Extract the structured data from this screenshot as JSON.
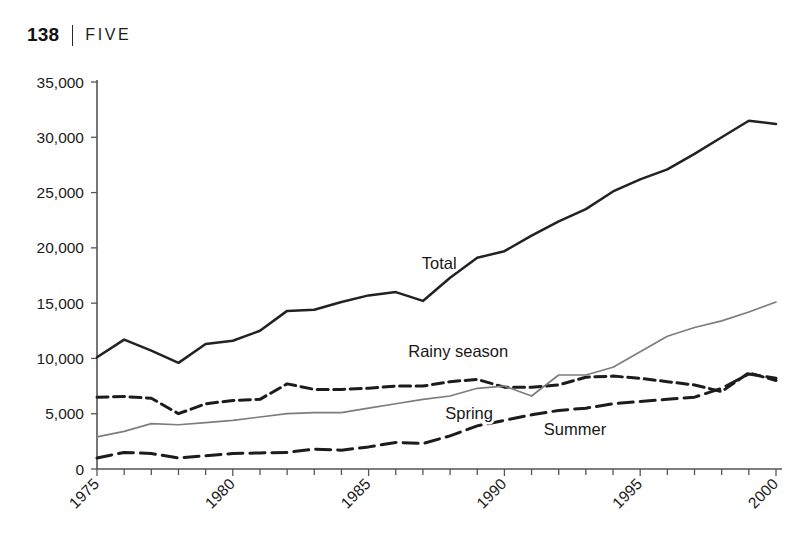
{
  "header": {
    "page_number": "138",
    "separator": "|",
    "chapter": "FIVE"
  },
  "chart_data": {
    "type": "line",
    "title": "",
    "xlabel": "",
    "ylabel": "",
    "xlim": [
      1975,
      2000
    ],
    "ylim": [
      0,
      35000
    ],
    "grid": false,
    "legend_position": "inline-labels",
    "y_ticks": [
      0,
      5000,
      10000,
      15000,
      20000,
      25000,
      30000,
      35000
    ],
    "y_tick_labels": [
      "0",
      "5,000",
      "10,000",
      "15,000",
      "20,000",
      "25,000",
      "30,000",
      "35,000"
    ],
    "x_ticks": [
      1975,
      1980,
      1985,
      1990,
      1995,
      2000
    ],
    "x_tick_labels": [
      "1975",
      "1980",
      "1985",
      "1990",
      "1995",
      "2000"
    ],
    "x_minor_ticks": [
      1976,
      1977,
      1978,
      1979,
      1981,
      1982,
      1983,
      1984,
      1986,
      1987,
      1988,
      1989,
      1991,
      1992,
      1993,
      1994,
      1996,
      1997,
      1998,
      1999
    ],
    "x": [
      1975,
      1976,
      1977,
      1978,
      1979,
      1980,
      1981,
      1982,
      1983,
      1984,
      1985,
      1986,
      1987,
      1988,
      1989,
      1990,
      1991,
      1992,
      1993,
      1994,
      1995,
      1996,
      1997,
      1998,
      1999,
      2000
    ],
    "series": [
      {
        "name": "Total",
        "style": "solid-thick-black",
        "color": "#222222",
        "label_x": 1987.6,
        "label_y": 18100,
        "values": [
          10100,
          11700,
          10700,
          9600,
          11300,
          11600,
          12500,
          14300,
          14400,
          15100,
          15700,
          16000,
          15200,
          17300,
          19100,
          19700,
          21100,
          22400,
          23500,
          25100,
          26200,
          27100,
          28500,
          30000,
          31500,
          31200
        ]
      },
      {
        "name": "Rainy season",
        "style": "dashed-thick-black",
        "color": "#1c1c1c",
        "label_x": 1988.3,
        "label_y": 10100,
        "values": [
          6500,
          6550,
          6400,
          5000,
          5900,
          6200,
          6300,
          7700,
          7200,
          7200,
          7300,
          7500,
          7500,
          7900,
          8100,
          7400,
          7400,
          7600,
          8300,
          8400,
          8200,
          7900,
          7600,
          7000,
          8700,
          8000
        ]
      },
      {
        "name": "Spring",
        "style": "solid-thin-gray",
        "color": "#7d7d7d",
        "label_x": 1988.7,
        "label_y": 4500,
        "values": [
          2900,
          3400,
          4100,
          4000,
          4200,
          4400,
          4700,
          5000,
          5100,
          5100,
          5500,
          5900,
          6300,
          6600,
          7300,
          7500,
          6600,
          8500,
          8500,
          9200,
          10600,
          12000,
          12800,
          13400,
          14200,
          15100
        ]
      },
      {
        "name": "Summer",
        "style": "dashed-long-black",
        "color": "#1c1c1c",
        "label_x": 1992.6,
        "label_y": 3100,
        "values": [
          1000,
          1500,
          1400,
          1000,
          1200,
          1400,
          1450,
          1500,
          1800,
          1700,
          2000,
          2400,
          2300,
          3000,
          3900,
          4400,
          4900,
          5300,
          5500,
          5900,
          6100,
          6300,
          6500,
          7300,
          8600,
          8200
        ]
      }
    ]
  }
}
